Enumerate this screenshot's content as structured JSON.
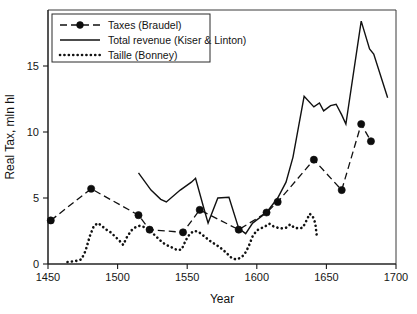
{
  "figure": {
    "background": "#ffffff",
    "frame_color": "#3a3a3a"
  },
  "axis": {
    "x_title": "Year",
    "y_title": "Real Tax, mln hl",
    "x_ticks": [
      "1450",
      "1500",
      "1550",
      "1600",
      "1650",
      "1700"
    ],
    "y_ticks": [
      "0",
      "5",
      "10",
      "15"
    ]
  },
  "legend": {
    "position": "top-left",
    "entries": [
      {
        "label": "Taxes (Braudel)",
        "style": "dashed-with-marker"
      },
      {
        "label": "Total revenue (Kiser & Linton)",
        "style": "solid"
      },
      {
        "label": "Taille (Bonney)",
        "style": "dotted"
      }
    ]
  },
  "chart_data": {
    "type": "line",
    "title": "",
    "subtitle": "",
    "xlabel": "Year",
    "ylabel": "Real Tax, mln hl",
    "xlim": [
      1450,
      1700
    ],
    "ylim": [
      0,
      19
    ],
    "xticks": [
      1450,
      1500,
      1550,
      1600,
      1650,
      1700
    ],
    "yticks": [
      0,
      5,
      10,
      15
    ],
    "grid": false,
    "legend_position": "upper left",
    "series": [
      {
        "name": "Taxes (Braudel)",
        "line_style": "dashed",
        "marker": "filled-circle",
        "color": "#111111",
        "points": [
          [
            1452,
            3.3
          ],
          [
            1481,
            5.7
          ],
          [
            1515,
            3.7
          ],
          [
            1523,
            2.6
          ],
          [
            1547,
            2.4
          ],
          [
            1559,
            4.1
          ],
          [
            1587,
            2.6
          ],
          [
            1607,
            3.9
          ],
          [
            1615,
            4.7
          ],
          [
            1641,
            7.9
          ],
          [
            1661,
            5.6
          ],
          [
            1675,
            10.6
          ],
          [
            1682,
            9.3
          ]
        ]
      },
      {
        "name": "Total revenue (Kiser & Linton)",
        "line_style": "solid",
        "marker": "none",
        "color": "#111111",
        "points": [
          [
            1515,
            6.9
          ],
          [
            1524,
            5.6
          ],
          [
            1531,
            4.9
          ],
          [
            1535,
            4.7
          ],
          [
            1545,
            5.6
          ],
          [
            1553,
            6.2
          ],
          [
            1556,
            6.5
          ],
          [
            1562,
            4.2
          ],
          [
            1565,
            3.1
          ],
          [
            1572,
            5.0
          ],
          [
            1580,
            5.05
          ],
          [
            1587,
            2.7
          ],
          [
            1592,
            2.3
          ],
          [
            1597,
            3.1
          ],
          [
            1607,
            3.9
          ],
          [
            1615,
            5.0
          ],
          [
            1621,
            6.2
          ],
          [
            1626,
            8.1
          ],
          [
            1630,
            10.4
          ],
          [
            1634,
            12.7
          ],
          [
            1641,
            11.9
          ],
          [
            1645,
            12.2
          ],
          [
            1648,
            11.6
          ],
          [
            1653,
            12.0
          ],
          [
            1657,
            12.1
          ],
          [
            1661,
            11.3
          ],
          [
            1664,
            10.6
          ],
          [
            1675,
            18.4
          ],
          [
            1681,
            16.3
          ],
          [
            1684,
            15.9
          ],
          [
            1694,
            12.6
          ]
        ]
      },
      {
        "name": "Taille (Bonney)",
        "line_style": "dotted",
        "marker": "none",
        "color": "#111111",
        "points": [
          [
            1464,
            0.15
          ],
          [
            1468,
            0.2
          ],
          [
            1471,
            0.25
          ],
          [
            1474,
            0.35
          ],
          [
            1477,
            1.0
          ],
          [
            1480,
            2.1
          ],
          [
            1483,
            2.9
          ],
          [
            1486,
            3.1
          ],
          [
            1489,
            2.85
          ],
          [
            1492,
            2.6
          ],
          [
            1495,
            2.4
          ],
          [
            1498,
            2.1
          ],
          [
            1501,
            1.8
          ],
          [
            1504,
            1.45
          ],
          [
            1507,
            2.1
          ],
          [
            1510,
            2.55
          ],
          [
            1513,
            2.8
          ],
          [
            1516,
            2.9
          ],
          [
            1519,
            2.8
          ],
          [
            1522,
            2.6
          ],
          [
            1525,
            2.35
          ],
          [
            1528,
            2.05
          ],
          [
            1531,
            1.75
          ],
          [
            1534,
            1.5
          ],
          [
            1537,
            1.35
          ],
          [
            1540,
            1.2
          ],
          [
            1543,
            1.05
          ],
          [
            1546,
            1.1
          ],
          [
            1549,
            1.8
          ],
          [
            1552,
            2.3
          ],
          [
            1555,
            2.5
          ],
          [
            1558,
            2.45
          ],
          [
            1561,
            2.2
          ],
          [
            1564,
            1.95
          ],
          [
            1567,
            1.7
          ],
          [
            1570,
            1.5
          ],
          [
            1573,
            1.3
          ],
          [
            1576,
            1.05
          ],
          [
            1579,
            0.75
          ],
          [
            1582,
            0.45
          ],
          [
            1585,
            0.35
          ],
          [
            1588,
            0.45
          ],
          [
            1591,
            0.7
          ],
          [
            1594,
            1.3
          ],
          [
            1597,
            2.1
          ],
          [
            1600,
            2.55
          ],
          [
            1603,
            2.7
          ],
          [
            1606,
            2.85
          ],
          [
            1609,
            3.05
          ],
          [
            1612,
            2.85
          ],
          [
            1615,
            2.75
          ],
          [
            1618,
            2.7
          ],
          [
            1621,
            2.75
          ],
          [
            1624,
            3.0
          ],
          [
            1627,
            2.75
          ],
          [
            1630,
            2.7
          ],
          [
            1633,
            2.75
          ],
          [
            1636,
            3.35
          ],
          [
            1638,
            3.8
          ],
          [
            1640,
            3.65
          ],
          [
            1642,
            3.1
          ],
          [
            1643,
            2.2
          ]
        ]
      }
    ]
  }
}
